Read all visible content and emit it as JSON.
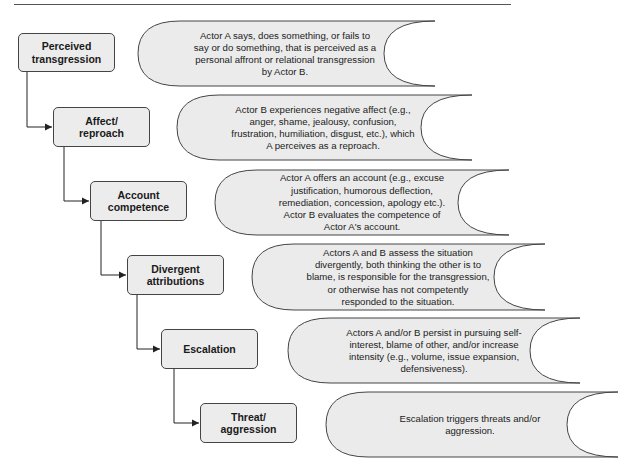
{
  "diagram": {
    "colors": {
      "box_fill": "#ececec",
      "scroll_fill": "#ebebeb",
      "stroke": "#444444",
      "background": "#ffffff"
    },
    "stages": [
      {
        "label_line1": "Perceived",
        "label_line2": "transgression",
        "description": "Actor A says, does something, or fails to say or do something, that is perceived as a personal affront or relational transgression by Actor B."
      },
      {
        "label_line1": "Affect/",
        "label_line2": "reproach",
        "description": "Actor B experiences negative affect (e.g., anger, shame, jealousy, confusion, frustration, humiliation, disgust, etc.), which A perceives as a reproach."
      },
      {
        "label_line1": "Account",
        "label_line2": "competence",
        "description": "Actor A offers an account (e.g., excuse justification, humorous deflection, remediation, concession, apology etc.). Actor B evaluates the competence of Actor A's account."
      },
      {
        "label_line1": "Divergent",
        "label_line2": "attributions",
        "description": "Actors A and B assess the situation divergently, both thinking the other is to blame, is responsible for the transgression, or otherwise has not competently responded to the situation."
      },
      {
        "label_line1": "Escalation",
        "label_line2": "",
        "description": "Actors A and/or B persist in pursuing self-interest, blame of other, and/or increase intensity (e.g., volume, issue expansion, defensiveness)."
      },
      {
        "label_line1": "Threat/",
        "label_line2": "aggression",
        "description": "Escalation triggers threats and/or aggression."
      }
    ]
  }
}
